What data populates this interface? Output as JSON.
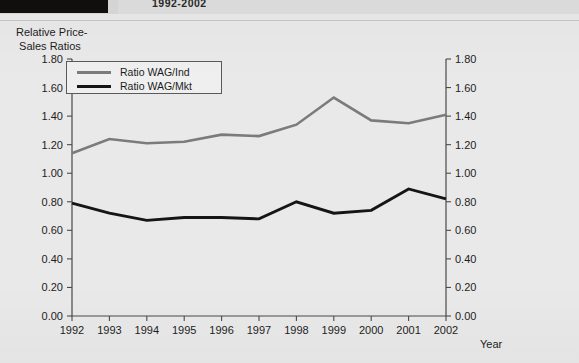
{
  "header": {
    "title_fragment": "1992-2002"
  },
  "chart_data": {
    "type": "line",
    "title": "",
    "ylabel": "Relative Price-\n Sales Ratios",
    "xlabel": "Year",
    "categories": [
      1992,
      1993,
      1994,
      1995,
      1996,
      1997,
      1998,
      1999,
      2000,
      2001,
      2002
    ],
    "xtick_labels": [
      "1992",
      "1993",
      "1994",
      "1995",
      "1996",
      "1997",
      "1998",
      "1999",
      "2000",
      "2001",
      "2002"
    ],
    "ylim": [
      0.0,
      1.8
    ],
    "ytick_values": [
      0.0,
      0.2,
      0.4,
      0.6,
      0.8,
      1.0,
      1.2,
      1.4,
      1.6,
      1.8
    ],
    "ytick_labels": [
      "0.00",
      "0.20",
      "0.40",
      "0.60",
      "0.80",
      "1.00",
      "1.20",
      "1.40",
      "1.60",
      "1.80"
    ],
    "right_axis_mirrored": true,
    "grid": false,
    "legend_position": "upper left",
    "series": [
      {
        "name": "Ratio WAG/Ind",
        "color": "#7b7b7b",
        "width": 2.6,
        "values": [
          1.14,
          1.24,
          1.21,
          1.22,
          1.27,
          1.26,
          1.34,
          1.53,
          1.37,
          1.35,
          1.41
        ]
      },
      {
        "name": "Ratio WAG/Mkt",
        "color": "#151515",
        "width": 2.9,
        "values": [
          0.79,
          0.72,
          0.67,
          0.69,
          0.69,
          0.68,
          0.8,
          0.72,
          0.74,
          0.89,
          0.82
        ]
      }
    ]
  }
}
